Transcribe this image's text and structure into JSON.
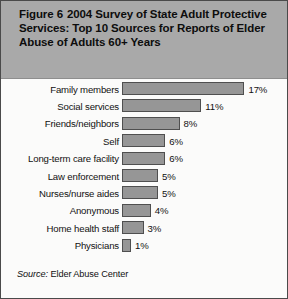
{
  "figure": {
    "number_label": "Figure 6",
    "title": "2004 Survey of State Adult Protective Services: Top 10 Sources for Reports of Elder Abuse of Adults 60+ Years",
    "source_label": "Source:",
    "source_text": "Elder Abuse Center",
    "band_color": "#a9a9a9",
    "bar_color": "#969696",
    "bar_border_color": "#4f4f4f",
    "border_color": "#4a4a4a"
  },
  "chart_data": {
    "type": "bar",
    "orientation": "horizontal",
    "xlabel": "",
    "ylabel": "",
    "xlim": [
      0,
      17
    ],
    "grid": false,
    "legend": false,
    "value_suffix": "%",
    "categories": [
      "Family members",
      "Social services",
      "Friends/neighbors",
      "Self",
      "Long-term care facility",
      "Law enforcement",
      "Nurses/nurse aides",
      "Anonymous",
      "Home health staff",
      "Physicians"
    ],
    "values": [
      17,
      11,
      8,
      6,
      6,
      5,
      5,
      4,
      3,
      1
    ],
    "labels": [
      "17%",
      "11%",
      "8%",
      "6%",
      "6%",
      "5%",
      "5%",
      "4%",
      "3%",
      "1%"
    ],
    "source": "Source: Elder Abuse Center"
  }
}
